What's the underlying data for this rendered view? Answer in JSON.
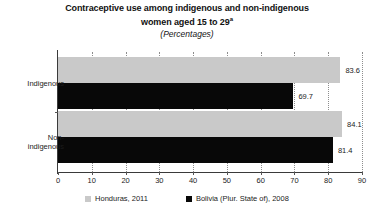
{
  "chart_data": {
    "type": "bar",
    "orientation": "horizontal",
    "title": "Contraceptive use among indigenous and non-indigenous women aged 15 to 29",
    "title_line1": "Contraceptive use among indigenous and non-indigenous",
    "title_line2": "women aged 15 to 29",
    "title_footnote_marker": "a",
    "subtitle": "(Percentages)",
    "xlabel": "",
    "ylabel": "",
    "xlim": [
      0,
      90
    ],
    "xticks": [
      "0",
      "10",
      "20",
      "30",
      "40",
      "50",
      "60",
      "70",
      "80",
      "90"
    ],
    "grid": true,
    "grid_style": "dotted-vertical",
    "legend_position": "bottom",
    "categories": [
      "Indigenous",
      "Non-indigenous"
    ],
    "category_labels": [
      {
        "lines": [
          "Indigenous"
        ]
      },
      {
        "lines": [
          "Non-",
          "indigenous"
        ]
      }
    ],
    "series": [
      {
        "name": "Honduras, 2011",
        "color": "#c9c9c9",
        "values": [
          83.6,
          84.1
        ],
        "value_labels": [
          "83.6",
          "84.1"
        ]
      },
      {
        "name": "Bolivia (Plur. State of), 2008",
        "color": "#080808",
        "values": [
          69.7,
          81.4
        ],
        "value_labels": [
          "69.7",
          "81.4"
        ]
      }
    ]
  },
  "legend": {
    "items": [
      {
        "label": "Honduras, 2011",
        "swatch": "gray"
      },
      {
        "label": "Bolivia (Plur. State of), 2008",
        "swatch": "black"
      }
    ]
  }
}
